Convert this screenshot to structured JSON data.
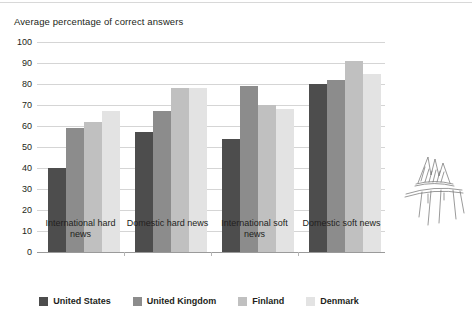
{
  "chart_data": {
    "type": "bar",
    "title": "Average percentage of correct answers",
    "xlabel": "",
    "ylabel": "",
    "ylim": [
      0,
      100
    ],
    "yticks": [
      100,
      90,
      80,
      70,
      60,
      50,
      40,
      30,
      20,
      10,
      0
    ],
    "grid": true,
    "legend_position": "bottom",
    "categories": [
      "International hard news",
      "Domestic hard news",
      "International soft news",
      "Domestic soft news"
    ],
    "series": [
      {
        "name": "United States",
        "color": "#4d4d4d",
        "values": [
          40,
          57,
          54,
          80
        ]
      },
      {
        "name": "United Kingdom",
        "color": "#8c8c8c",
        "values": [
          59,
          67,
          79,
          82
        ]
      },
      {
        "name": "Finland",
        "color": "#c0c0c0",
        "values": [
          62,
          78,
          70,
          91
        ]
      },
      {
        "name": "Denmark",
        "color": "#e3e3e3",
        "values": [
          67,
          78,
          68,
          85
        ]
      }
    ]
  },
  "decoration": {
    "sketch_name": "pavilion-sketch"
  }
}
